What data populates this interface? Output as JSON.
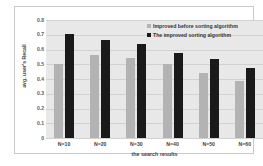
{
  "chart_data": {
    "type": "bar",
    "title": "",
    "xlabel": "the search results",
    "ylabel": "avg. user's Recall",
    "categories": [
      "N=10",
      "N=20",
      "N=30",
      "N=40",
      "N=50",
      "N=60"
    ],
    "series": [
      {
        "name": "Improved before sorting algorithm",
        "color": "#b3b3b3",
        "values": [
          0.505,
          0.56,
          0.545,
          0.505,
          0.44,
          0.385
        ]
      },
      {
        "name": "The improved sorting algorithm",
        "color": "#1a1a1a",
        "values": [
          0.705,
          0.665,
          0.635,
          0.575,
          0.535,
          0.475
        ]
      }
    ],
    "ylim": [
      0,
      0.8
    ],
    "ytick_labels": [
      "0.8",
      "0.7",
      "0.6",
      "0.5",
      "0.4",
      "0.3",
      "0.2",
      "0.1",
      "0"
    ],
    "ytick_values": [
      0.8,
      0.7,
      0.6,
      0.5,
      0.4,
      0.3,
      0.2,
      0.1,
      0
    ],
    "grid": true,
    "legend_position": "top-right",
    "plot_background": "#e8e8e8",
    "gridline_color": "#d2d2d2"
  }
}
